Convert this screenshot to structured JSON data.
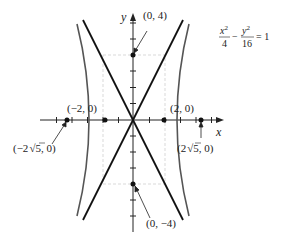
{
  "equation": {
    "text": "x²/4 − y²/16 = 1",
    "num1": "x",
    "sup1": "2",
    "den1": "4",
    "minus": "−",
    "num2": "y",
    "sup2": "2",
    "den2": "16",
    "rhs": "= 1"
  },
  "axes": {
    "x_label": "x",
    "y_label": "y"
  },
  "points": [
    {
      "id": "top",
      "label": "(0, 4)",
      "x": 0,
      "y": 4
    },
    {
      "id": "bottom",
      "label": "(0, −4)",
      "x": 0,
      "y": -4
    },
    {
      "id": "vertex_left",
      "label": "(−2, 0)",
      "x": -2,
      "y": 0
    },
    {
      "id": "vertex_right",
      "label": "(2, 0)",
      "x": 2,
      "y": 0
    },
    {
      "id": "focus_left",
      "label_pre": "(−2",
      "label_post": "5, 0)",
      "label": "(−2√5, 0)",
      "x": -4.472,
      "y": 0
    },
    {
      "id": "focus_right",
      "label_pre": "(2",
      "label_post": "5, 0)",
      "label": "(2√5, 0)",
      "x": 4.472,
      "y": 0
    }
  ],
  "asymptotes": [
    "y = 2x",
    "y = −2x"
  ],
  "central_box": {
    "x": [
      -2,
      2
    ],
    "y": [
      -4,
      4
    ]
  },
  "colors": {
    "axis": "#222222",
    "asymptote": "#111111",
    "hyperbola": "#555555",
    "box": "#cccccc"
  }
}
